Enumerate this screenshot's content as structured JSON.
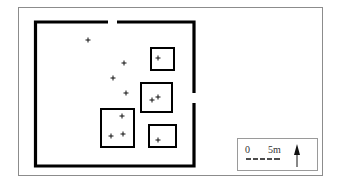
{
  "diagram": {
    "type": "archaeological site plan",
    "legend": {
      "scale_start": "0",
      "scale_end": "5m",
      "north_arrow": "north-arrow-icon"
    },
    "walls": {
      "color": "#000000"
    },
    "structures": [
      {
        "id": "A",
        "x": 151,
        "y": 48,
        "w": 23,
        "h": 22,
        "markers": [
          [
            158,
            58
          ]
        ]
      },
      {
        "id": "B",
        "x": 141,
        "y": 83,
        "w": 31,
        "h": 29,
        "markers": [
          [
            152,
            100
          ],
          [
            158,
            97
          ]
        ]
      },
      {
        "id": "C",
        "x": 101,
        "y": 109,
        "w": 33,
        "h": 38,
        "markers": [
          [
            122,
            116
          ],
          [
            111,
            136
          ],
          [
            123,
            134
          ]
        ]
      },
      {
        "id": "D",
        "x": 149,
        "y": 125,
        "w": 27,
        "h": 22,
        "markers": [
          [
            158,
            140
          ]
        ]
      }
    ],
    "loose_markers": [
      [
        88,
        40
      ],
      [
        124,
        63
      ],
      [
        113,
        78
      ],
      [
        126,
        93
      ]
    ]
  }
}
